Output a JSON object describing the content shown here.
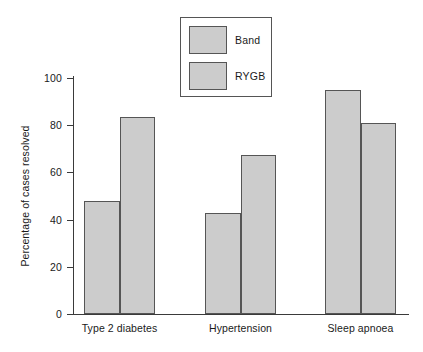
{
  "chart_data": {
    "type": "bar",
    "title": "",
    "xlabel": "",
    "ylabel": "Percentage of cases resolved",
    "categories": [
      "Type 2 diabetes",
      "Hypertension",
      "Sleep apnoea"
    ],
    "series": [
      {
        "name": "Band",
        "values": [
          48,
          43,
          95
        ],
        "color": "#cccccc"
      },
      {
        "name": "RYGB",
        "values": [
          83.5,
          67.5,
          81
        ],
        "color": "#cccccc"
      }
    ],
    "ylim": [
      0,
      100
    ],
    "yticks": [
      0,
      20,
      40,
      60,
      80,
      100
    ],
    "ytick_labels": [
      "0",
      "20",
      "40",
      "60",
      "80",
      "100"
    ],
    "grid": false,
    "legend_position": "top-center",
    "legend_boxed": true
  },
  "style": {
    "bar_fill": "#cccccc",
    "bar_stroke": "#555555",
    "axis_color": "#3a3a3a",
    "background": "#ffffff",
    "text_color": "#1a1a1a"
  }
}
